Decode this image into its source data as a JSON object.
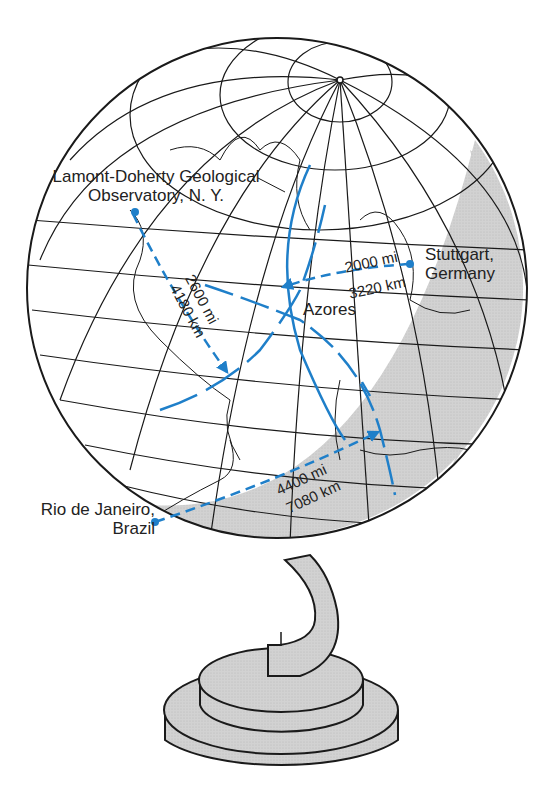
{
  "figure": {
    "colors": {
      "route_blue": "#1f7fc9",
      "line_black": "#1a1a1a",
      "shadow_gray": "#cfcfcf",
      "base_gray": "#d4d4d4"
    }
  },
  "labels": {
    "lamont_line1": "Lamont-Doherty Geological",
    "lamont_line2": "Observatory, N. Y.",
    "stuttgart_line1": "Stuttgart,",
    "stuttgart_line2": "Germany",
    "azores": "Azores",
    "rio_line1": "Rio de Janeiro,",
    "rio_line2": "Brazil"
  },
  "routes": [
    {
      "from": "Lamont-Doherty Geological Observatory, N. Y.",
      "to": "Azores",
      "miles": "2600 mi",
      "km": "4180 km"
    },
    {
      "from": "Stuttgart, Germany",
      "to": "Azores",
      "miles": "2000 mi",
      "km": "3220 km"
    },
    {
      "from": "Rio de Janeiro, Brazil",
      "to": "Azores",
      "miles": "4400 mi",
      "km": "7080 km"
    }
  ]
}
